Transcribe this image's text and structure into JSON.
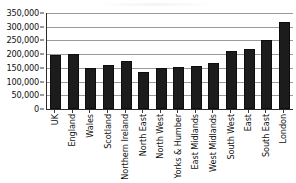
{
  "chart_data": {
    "type": "bar",
    "title": "",
    "subtitle": "",
    "xlabel": "",
    "ylabel": "",
    "ylim": [
      0,
      350000
    ],
    "yticks": [
      0,
      50000,
      100000,
      150000,
      200000,
      250000,
      300000,
      350000
    ],
    "ytick_labels": [
      "0",
      "50,000",
      "100,000",
      "150,000",
      "200,000",
      "250,000",
      "300,000",
      "350,000"
    ],
    "grid": true,
    "legend": false,
    "legend_position": "none",
    "bar_color": "#1c1c1c",
    "gridline_color": "#9a9a9a",
    "axis_color": "#2b2b2b",
    "categories": [
      "UK",
      "England",
      "Wales",
      "Scotland",
      "Northern Ireland",
      "North East",
      "North West",
      "Yorks & Humber",
      "East Midlands",
      "West Midlands",
      "South West",
      "East",
      "South East",
      "London"
    ],
    "values": [
      197000,
      202000,
      149000,
      160000,
      176000,
      135000,
      151000,
      153000,
      156000,
      168000,
      211000,
      219000,
      253000,
      316000
    ]
  }
}
